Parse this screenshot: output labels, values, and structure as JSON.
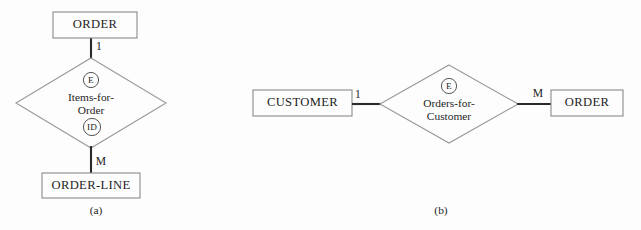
{
  "figure": {
    "background_color": "#fdfdfd",
    "line_color": "#2b2b2b",
    "shape_stroke_color": "#8a8a8a"
  },
  "diagrams": [
    {
      "id": "a",
      "caption": "(a)",
      "caption_x": 96,
      "caption_y": 211,
      "layout": "vertical",
      "parent_entity": {
        "name": "ORDER",
        "x": 53,
        "y": 12,
        "width": 84,
        "height": 26
      },
      "relationship": {
        "name_line1": "Items-for-",
        "name_line2": "Order",
        "center_x": 91,
        "center_y": 103,
        "half_width": 75,
        "half_height": 45,
        "top_marker": "E",
        "bottom_marker": "ID"
      },
      "child_entity": {
        "name": "ORDER-LINE",
        "x": 42,
        "y": 173,
        "width": 98,
        "height": 25
      },
      "connectors": [
        {
          "from": "parent_entity",
          "to": "relationship",
          "cardinality": "1",
          "label_x": 99,
          "label_y": 47
        },
        {
          "from": "relationship",
          "to": "child_entity",
          "cardinality": "M",
          "label_x": 101,
          "label_y": 162
        }
      ]
    },
    {
      "id": "b",
      "caption": "(b)",
      "caption_x": 441,
      "caption_y": 211,
      "layout": "horizontal",
      "left_entity": {
        "name": "CUSTOMER",
        "x": 253,
        "y": 90,
        "width": 99,
        "height": 26
      },
      "relationship": {
        "name_line1": "Orders-for-",
        "name_line2": "Customer",
        "center_x": 449,
        "center_y": 104,
        "half_width": 69,
        "half_height": 39,
        "top_marker": "E",
        "bottom_marker": ""
      },
      "right_entity": {
        "name": "ORDER",
        "x": 551,
        "y": 90,
        "width": 72,
        "height": 26
      },
      "connectors": [
        {
          "from": "left_entity",
          "to": "relationship",
          "cardinality": "1",
          "label_x": 358,
          "label_y": 95
        },
        {
          "from": "relationship",
          "to": "right_entity",
          "cardinality": "M",
          "label_x": 538,
          "label_y": 94
        }
      ]
    }
  ]
}
